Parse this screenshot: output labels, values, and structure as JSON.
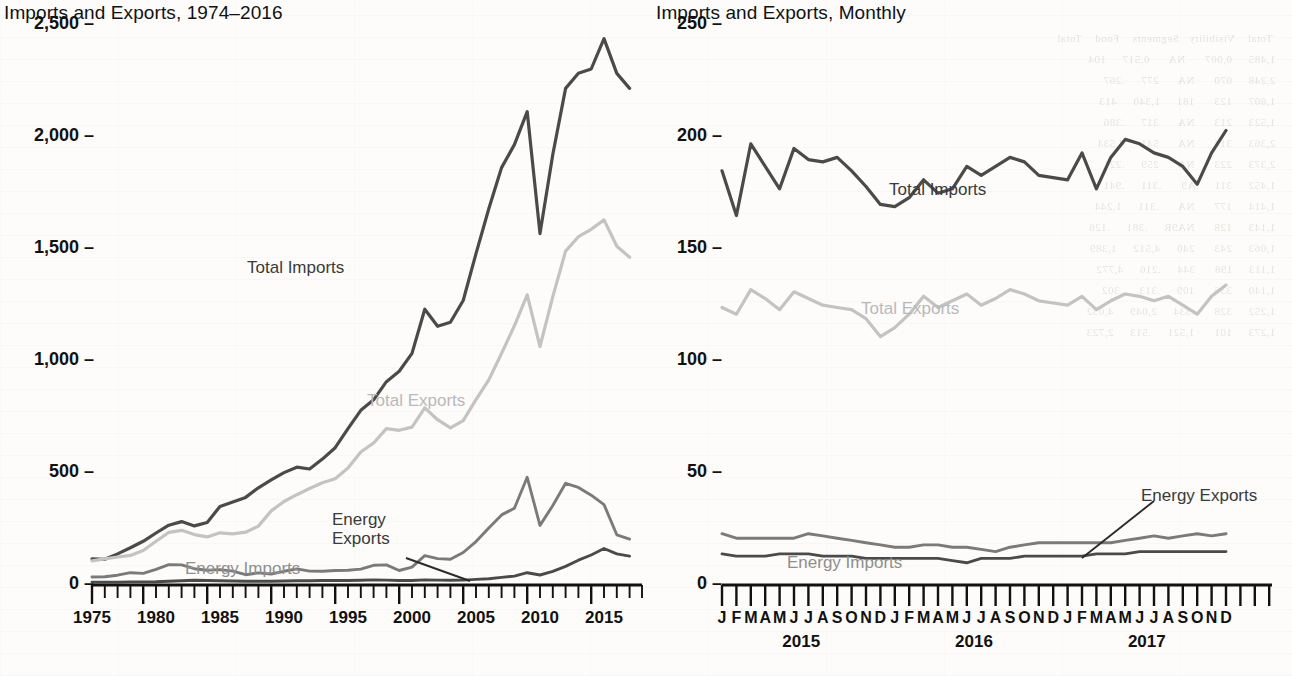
{
  "panels": {
    "annual": {
      "title": "Imports and Exports, 1974–2016",
      "y_ticks": [
        "0",
        "500",
        "1,000",
        "1,500",
        "2,000",
        "2,500"
      ],
      "x_ticks": [
        "1975",
        "1980",
        "1985",
        "1990",
        "1995",
        "2000",
        "2005",
        "2010",
        "2015"
      ],
      "labels": {
        "total_imports": "Total Imports",
        "total_exports": "Total Exports",
        "energy_exports": "Energy\nExports",
        "energy_imports": "Energy Imports"
      }
    },
    "monthly": {
      "title": "Imports and Exports, Monthly",
      "y_ticks": [
        "0",
        "50",
        "100",
        "150",
        "200",
        "250"
      ],
      "month_letters": [
        "J",
        "F",
        "M",
        "A",
        "M",
        "J",
        "J",
        "A",
        "S",
        "O",
        "N",
        "D"
      ],
      "year_ticks": [
        "2015",
        "2016",
        "2017"
      ],
      "labels": {
        "total_imports": "Total Imports",
        "total_exports": "Total Exports",
        "energy_exports": "Energy Exports",
        "energy_imports": "Energy Imports"
      }
    }
  },
  "colors": {
    "total_imports": "#4a4a4a",
    "total_exports": "#c3c3c3",
    "energy_imports": "#7a7a7a",
    "energy_exports": "#4a4a4a",
    "axis": "#111111",
    "background": "#fdfcfa"
  },
  "chart_data": [
    {
      "type": "line",
      "title": "Imports and Exports, 1974–2016",
      "xlabel": "",
      "ylabel": "",
      "xlim": [
        1974,
        2016
      ],
      "ylim": [
        0,
        2600
      ],
      "grid": false,
      "legend": "inline-annotations",
      "x": [
        1974,
        1975,
        1976,
        1977,
        1978,
        1979,
        1980,
        1981,
        1982,
        1983,
        1984,
        1985,
        1986,
        1987,
        1988,
        1989,
        1990,
        1991,
        1992,
        1993,
        1994,
        1995,
        1996,
        1997,
        1998,
        1999,
        2000,
        2001,
        2002,
        2003,
        2004,
        2005,
        2006,
        2007,
        2008,
        2009,
        2010,
        2011,
        2012,
        2013,
        2014,
        2015,
        2016
      ],
      "series": [
        {
          "name": "Total Imports",
          "values": [
            108,
            106,
            130,
            157,
            186,
            223,
            258,
            274,
            255,
            270,
            342,
            362,
            382,
            425,
            460,
            493,
            517,
            509,
            553,
            604,
            689,
            771,
            818,
            899,
            945,
            1025,
            1222,
            1146,
            1164,
            1261,
            1470,
            1671,
            1855,
            1957,
            2104,
            1560,
            1913,
            2208,
            2276,
            2294,
            2385,
            2248,
            2208
          ]
        },
        {
          "name": "Total Exports",
          "values": [
            99,
            108,
            116,
            123,
            145,
            186,
            226,
            238,
            216,
            206,
            224,
            219,
            227,
            254,
            322,
            364,
            394,
            422,
            448,
            465,
            513,
            585,
            625,
            689,
            682,
            696,
            782,
            729,
            693,
            725,
            819,
            907,
            1026,
            1148,
            1287,
            1056,
            1278,
            1482,
            1546,
            1579,
            1621,
            1503,
            1455
          ]
        },
        {
          "name": "Energy Imports",
          "values": [
            27,
            28,
            35,
            46,
            43,
            61,
            82,
            81,
            64,
            57,
            60,
            53,
            37,
            45,
            40,
            52,
            63,
            53,
            52,
            56,
            57,
            62,
            79,
            81,
            56,
            71,
            122,
            109,
            106,
            136,
            185,
            246,
            304,
            334,
            472,
            257,
            346,
            445,
            427,
            392,
            350,
            215,
            196
          ]
        },
        {
          "name": "Energy Exports",
          "values": [
            4,
            4,
            4,
            5,
            5,
            6,
            8,
            10,
            12,
            11,
            10,
            9,
            8,
            8,
            8,
            9,
            10,
            10,
            11,
            11,
            11,
            12,
            14,
            13,
            11,
            11,
            14,
            13,
            12,
            13,
            16,
            19,
            25,
            31,
            46,
            36,
            52,
            74,
            102,
            125,
            154,
            130,
            120
          ]
        }
      ]
    },
    {
      "type": "line",
      "title": "Imports and Exports, Monthly",
      "xlabel": "",
      "ylabel": "",
      "ylim": [
        0,
        260
      ],
      "grid": false,
      "legend": "inline-annotations",
      "x": [
        "2015-J",
        "2015-F",
        "2015-M",
        "2015-A",
        "2015-M",
        "2015-J",
        "2015-J",
        "2015-A",
        "2015-S",
        "2015-O",
        "2015-N",
        "2015-D",
        "2016-J",
        "2016-F",
        "2016-M",
        "2016-A",
        "2016-M",
        "2016-J",
        "2016-J",
        "2016-A",
        "2016-S",
        "2016-O",
        "2016-N",
        "2016-D",
        "2017-J",
        "2017-F",
        "2017-M",
        "2017-A",
        "2017-M",
        "2017-J",
        "2017-J",
        "2017-A",
        "2017-S",
        "2017-O",
        "2017-N",
        "2017-D"
      ],
      "series": [
        {
          "name": "Total Imports",
          "values": [
            184,
            164,
            196,
            186,
            176,
            194,
            189,
            188,
            190,
            184,
            177,
            169,
            168,
            172,
            180,
            174,
            176,
            186,
            182,
            186,
            190,
            188,
            182,
            181,
            180,
            192,
            176,
            190,
            198,
            196,
            192,
            190,
            186,
            178,
            192,
            202
          ]
        },
        {
          "name": "Total Exports",
          "values": [
            123,
            120,
            131,
            127,
            122,
            130,
            127,
            124,
            123,
            122,
            118,
            110,
            114,
            120,
            128,
            123,
            126,
            129,
            124,
            127,
            131,
            129,
            126,
            125,
            124,
            128,
            122,
            126,
            129,
            128,
            126,
            128,
            124,
            120,
            128,
            133
          ]
        },
        {
          "name": "Energy Imports",
          "values": [
            22,
            20,
            20,
            20,
            20,
            20,
            22,
            21,
            20,
            19,
            18,
            17,
            16,
            16,
            17,
            17,
            16,
            16,
            15,
            14,
            16,
            17,
            18,
            18,
            18,
            18,
            18,
            18,
            19,
            20,
            21,
            20,
            21,
            22,
            21,
            22
          ]
        },
        {
          "name": "Energy Exports",
          "values": [
            13,
            12,
            12,
            12,
            13,
            13,
            13,
            12,
            12,
            12,
            11,
            11,
            11,
            11,
            11,
            11,
            10,
            9,
            11,
            11,
            11,
            12,
            12,
            12,
            12,
            12,
            13,
            13,
            13,
            14,
            14,
            14,
            14,
            14,
            14,
            14
          ]
        }
      ]
    }
  ]
}
